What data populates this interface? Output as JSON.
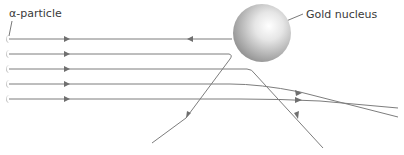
{
  "diagram": {
    "labels": {
      "alpha_particle": "α-particle",
      "gold_nucleus": "Gold nucleus"
    },
    "colors": {
      "path": "#7d7d7d",
      "arrow": "#6f6f6f",
      "nucleus_light": "#ffffff",
      "nucleus_dark": "#8a8a8a",
      "text": "#3a3a3a"
    },
    "nucleus": {
      "cx": 262,
      "cy": 33,
      "r": 29
    },
    "particles": [
      {
        "id": 1,
        "y": 39,
        "behaviour": "reflected back toward source"
      },
      {
        "id": 2,
        "y": 54,
        "behaviour": "deflected sharply downward-left"
      },
      {
        "id": 3,
        "y": 69,
        "behaviour": "deflected downward-right"
      },
      {
        "id": 4,
        "y": 84,
        "behaviour": "slightly deflected downward"
      },
      {
        "id": 5,
        "y": 99,
        "behaviour": "barely deflected"
      }
    ]
  }
}
